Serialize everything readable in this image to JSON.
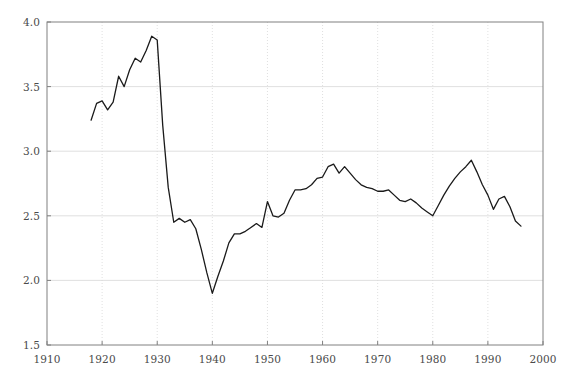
{
  "chart_data": {
    "type": "line",
    "title": "",
    "subtitle": "",
    "xlabel": "",
    "ylabel": "",
    "xlim": [
      1910,
      2000
    ],
    "ylim": [
      1.5,
      4.0
    ],
    "grid": true,
    "legend": null,
    "legend_position": "none",
    "line_color": "#1a1a1a",
    "grid_color": "#d8d8d8",
    "axis_color": "#808080",
    "tick_label_color": "#4a4a4a",
    "background_color": "#ffffff",
    "xticks": [
      1910,
      1920,
      1930,
      1940,
      1950,
      1960,
      1970,
      1980,
      1990,
      2000
    ],
    "xtick_labels": [
      "1910",
      "1920",
      "1930",
      "1940",
      "1950",
      "1960",
      "1970",
      "1980",
      "1990",
      "2000"
    ],
    "yticks": [
      1.5,
      2.0,
      2.5,
      3.0,
      3.5,
      4.0
    ],
    "ytick_labels": [
      "1.5",
      "2.0",
      "2.5",
      "3.0",
      "3.5",
      "4.0"
    ],
    "series": [
      {
        "name": "series-1",
        "x": [
          1918,
          1919,
          1920,
          1921,
          1922,
          1923,
          1924,
          1925,
          1926,
          1927,
          1928,
          1929,
          1930,
          1931,
          1932,
          1933,
          1934,
          1935,
          1936,
          1937,
          1938,
          1939,
          1940,
          1941,
          1942,
          1943,
          1944,
          1945,
          1946,
          1947,
          1948,
          1949,
          1950,
          1951,
          1952,
          1953,
          1954,
          1955,
          1956,
          1957,
          1958,
          1959,
          1960,
          1961,
          1962,
          1963,
          1964,
          1965,
          1966,
          1967,
          1968,
          1969,
          1970,
          1971,
          1972,
          1973,
          1974,
          1975,
          1976,
          1977,
          1978,
          1979,
          1980,
          1981,
          1982,
          1983,
          1984,
          1985,
          1986,
          1987,
          1988,
          1989,
          1990,
          1991,
          1992,
          1993,
          1994,
          1995,
          1996
        ],
        "y": [
          3.24,
          3.37,
          3.39,
          3.32,
          3.38,
          3.58,
          3.5,
          3.63,
          3.72,
          3.69,
          3.78,
          3.89,
          3.86,
          3.2,
          2.72,
          2.45,
          2.48,
          2.45,
          2.47,
          2.4,
          2.24,
          2.06,
          1.9,
          2.03,
          2.15,
          2.29,
          2.36,
          2.36,
          2.38,
          2.41,
          2.44,
          2.41,
          2.61,
          2.5,
          2.49,
          2.52,
          2.62,
          2.7,
          2.7,
          2.71,
          2.74,
          2.79,
          2.8,
          2.88,
          2.9,
          2.83,
          2.88,
          2.83,
          2.78,
          2.74,
          2.72,
          2.71,
          2.69,
          2.69,
          2.7,
          2.66,
          2.62,
          2.61,
          2.63,
          2.6,
          2.56,
          2.53,
          2.5,
          2.58,
          2.66,
          2.73,
          2.79,
          2.84,
          2.88,
          2.93,
          2.84,
          2.74,
          2.66,
          2.55,
          2.63,
          2.65,
          2.57,
          2.46,
          2.42
        ]
      }
    ]
  }
}
